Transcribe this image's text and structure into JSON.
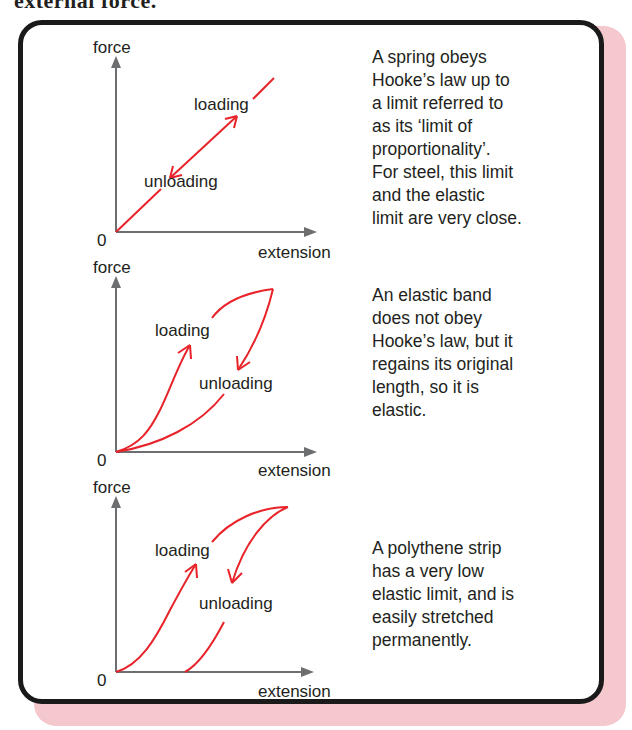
{
  "top_fragment": "external force.",
  "colors": {
    "curve": "#e8232a",
    "axis": "#6d6e70",
    "border": "#1a1a1a",
    "shadow": "#f5c8cd",
    "text": "#231f20"
  },
  "panels": [
    {
      "id": "spring",
      "axes": {
        "y_label": "force",
        "x_label": "extension",
        "origin_label": "0"
      },
      "curve_labels": {
        "loading": "loading",
        "unloading": "unloading"
      },
      "description_lines": [
        "A spring obeys",
        "Hooke’s law up to",
        "a limit referred to",
        "as its ‘limit of",
        "proportionality’.",
        "For steel, this limit",
        "and the elastic",
        "limit are very close."
      ]
    },
    {
      "id": "elastic-band",
      "axes": {
        "y_label": "force",
        "x_label": "extension",
        "origin_label": "0"
      },
      "curve_labels": {
        "loading": "loading",
        "unloading": "unloading"
      },
      "description_lines": [
        "An elastic band",
        "does not obey",
        "Hooke’s law, but it",
        "regains its original",
        "length, so it is",
        "elastic."
      ]
    },
    {
      "id": "polythene-strip",
      "axes": {
        "y_label": "force",
        "x_label": "extension",
        "origin_label": "0"
      },
      "curve_labels": {
        "loading": "loading",
        "unloading": "unloading"
      },
      "description_lines": [
        "A polythene strip",
        "has a very low",
        "elastic limit, and is",
        "easily stretched",
        "permanently."
      ]
    }
  ]
}
